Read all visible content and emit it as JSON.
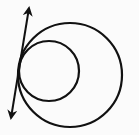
{
  "diagram": {
    "colors": {
      "stroke": "#111111",
      "background": "#fbfbfb"
    },
    "large_circle": {
      "cx": 70,
      "cy": 75,
      "r": 52
    },
    "small_circle": {
      "cx": 49,
      "cy": 71,
      "r": 30
    },
    "tangent_line": {
      "x1": 29,
      "y1": 8,
      "x2": 11,
      "y2": 118,
      "arrows": "both"
    }
  }
}
